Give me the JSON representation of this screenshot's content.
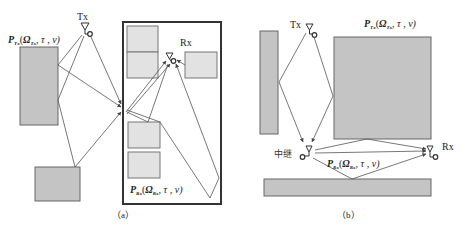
{
  "diagram": {
    "panel_a": {
      "caption": "（a）",
      "tx_label": "Tx",
      "rx_label": "Rx",
      "tx_param": {
        "symbol": "P",
        "sub": "Tx",
        "args_omega": "Ω",
        "args_omega_sub": "Tx",
        "args_rest": ", τ , ν)"
      },
      "rx_param": {
        "symbol": "P",
        "sub": "Rx",
        "args_omega": "Ω",
        "args_omega_sub": "Rx",
        "args_rest": ", τ , ν)"
      }
    },
    "panel_b": {
      "caption": "（b）",
      "tx_label": "Tx",
      "rx_label": "Rx",
      "relay_label": "中继",
      "tx_param": {
        "symbol": "P",
        "sub": "Tx",
        "args_omega": "Ω",
        "args_omega_sub": "Tx",
        "args_rest": ", τ , ν)"
      },
      "rx_param": {
        "symbol": "P",
        "sub": "Rx",
        "args_omega": "Ω",
        "args_omega_sub": "Rx",
        "args_rest": ", τ , ν)"
      }
    },
    "colors": {
      "scatterer_fill": "#c8c8c8",
      "scatterer_light_fill": "#e0e0e0",
      "stroke": "#555555",
      "frame": "#333333"
    }
  }
}
